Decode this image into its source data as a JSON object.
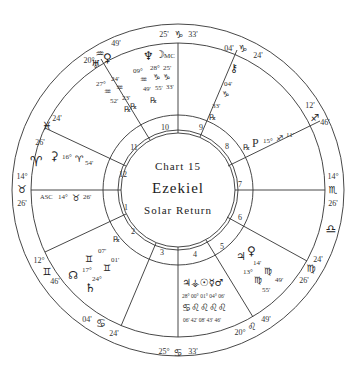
{
  "chart": {
    "title_line1": "Chart 15",
    "title_line2": "Ezekiel",
    "title_line3": "Solar Return",
    "colors": {
      "line": "#333333",
      "text": "#2a2a2a",
      "background": "#ffffff"
    }
  },
  "cusps": [
    {
      "house": 1,
      "label": "ASC",
      "deg": "14°",
      "sign": "♉",
      "min": "26'"
    },
    {
      "house": 2,
      "deg": "12°",
      "sign": "♊",
      "min": "46'"
    },
    {
      "house": 3,
      "deg": "04'",
      "sign": "♋",
      "min": "24'"
    },
    {
      "house": 4,
      "deg": "25°",
      "sign": "♋",
      "min": "33'"
    },
    {
      "house": 5,
      "deg": "20°",
      "sign": "♌",
      "min": "49'"
    },
    {
      "house": 6,
      "deg": "24'",
      "sign": "♍",
      "min": "26'"
    },
    {
      "house": 7,
      "deg": "14°",
      "sign": "♏",
      "min": "26'"
    },
    {
      "house": 8,
      "deg": "12'",
      "sign": "♐",
      "min": "46'"
    },
    {
      "house": 9,
      "deg": "04'",
      "sign": "♑",
      "min": "24'"
    },
    {
      "house": 10,
      "label": "MC",
      "deg": "25'",
      "sign": "♑",
      "min": "33'"
    },
    {
      "house": 11,
      "deg": "20°",
      "sign": "♒",
      "min": "49'"
    },
    {
      "house": 12,
      "deg": "24'",
      "sign": "♓",
      "min": "26'"
    }
  ],
  "intercepted": [
    {
      "sign": "♈",
      "name": "Aries"
    },
    {
      "sign": "♎",
      "name": "Libra"
    }
  ],
  "house_numbers": [
    "1",
    "2",
    "3",
    "4",
    "5",
    "6",
    "7",
    "8",
    "9",
    "10",
    "11",
    "12"
  ],
  "planets": {
    "neptune": {
      "glyph": "♆",
      "deg": "09°",
      "sign": "♒",
      "min": "49'"
    },
    "moon": {
      "glyph": "☽",
      "deg": "28°",
      "sign": "♑",
      "min": "55'"
    },
    "mc": {
      "label": "MC",
      "deg": "25'",
      "sign": "♑",
      "min": "33'"
    },
    "uranus": {
      "glyph": "♅",
      "deg": "27°",
      "sign": "♒",
      "min": "52'",
      "retro": "℞"
    },
    "venus_top": {
      "glyph": "♀",
      "deg": "24'",
      "sign": "♒",
      "min": "23'",
      "retro": "℞"
    },
    "chiron": {
      "glyph": "⚷",
      "deg": "04'",
      "sign": "♑",
      "min": "33'",
      "retro": "℞"
    },
    "pluto": {
      "glyph": "P",
      "deg": "15°",
      "sign": "♐",
      "min": "11'",
      "retro": "℞"
    },
    "ceres": {
      "glyph": "⚳",
      "deg": "16°",
      "sign": "♈",
      "min": "54'"
    },
    "asc_label": {
      "label": "ASC",
      "deg": "14°",
      "sign": "♉",
      "min": "26'"
    },
    "mercury_g": {
      "glyph": "♊",
      "deg": "07'",
      "retro": "℞"
    },
    "node": {
      "glyph": "☊",
      "deg": "17°",
      "sign": "♊",
      "min": "01'"
    },
    "saturn": {
      "glyph": "♄",
      "deg": "24°"
    },
    "jupiter": {
      "glyph": "♃",
      "deg": "13°",
      "sign": "♍",
      "min": "55'"
    },
    "venus": {
      "glyph": "♀",
      "deg": "14'",
      "sign": "♍",
      "min": "49'"
    },
    "stellium_4": {
      "glyphs": "♃⚶☉☿♂",
      "degs": "28° 00° 01° 04° 06'",
      "signs": "♋♌♌♌♌",
      "mins": "06' 42' 08' 43' 46'"
    }
  },
  "retro": "℞"
}
